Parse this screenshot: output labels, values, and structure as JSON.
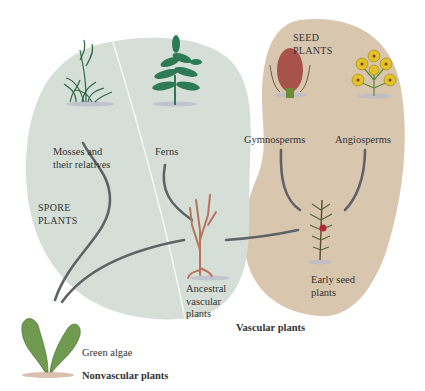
{
  "diagram": {
    "colors": {
      "spore_region": "#d5dfd7",
      "seed_region": "#d9c6ae",
      "connector": "#5f6366",
      "moss": "#2f6b4a",
      "fern": "#2d7a55",
      "ancestral": "#b8735a",
      "cone": "#a8524c",
      "flower": "#e3c227",
      "algae": "#6f9a4f"
    },
    "groups": {
      "seed_plants": [
        "SEED",
        "PLANTS"
      ],
      "spore_plants": [
        "SPORE",
        "PLANTS"
      ],
      "vascular_plants": "Vascular plants",
      "nonvascular_plants": "Nonvascular plants"
    },
    "nodes": {
      "mosses": [
        "Mosses and",
        "their relatives"
      ],
      "ferns": [
        "Ferns"
      ],
      "gymnosperms": [
        "Gymnosperms"
      ],
      "angiosperms": [
        "Angiosperms"
      ],
      "ancestral_vascular": [
        "Ancestral",
        "vascular",
        "plants"
      ],
      "early_seed": [
        "Early seed",
        "plants"
      ],
      "green_algae": [
        "Green algae"
      ]
    },
    "edges": [
      {
        "from": "green_algae",
        "to": "mosses"
      },
      {
        "from": "green_algae",
        "to": "ancestral_vascular"
      },
      {
        "from": "ancestral_vascular",
        "to": "ferns"
      },
      {
        "from": "ancestral_vascular",
        "to": "early_seed"
      },
      {
        "from": "early_seed",
        "to": "gymnosperms"
      },
      {
        "from": "early_seed",
        "to": "angiosperms"
      }
    ]
  }
}
